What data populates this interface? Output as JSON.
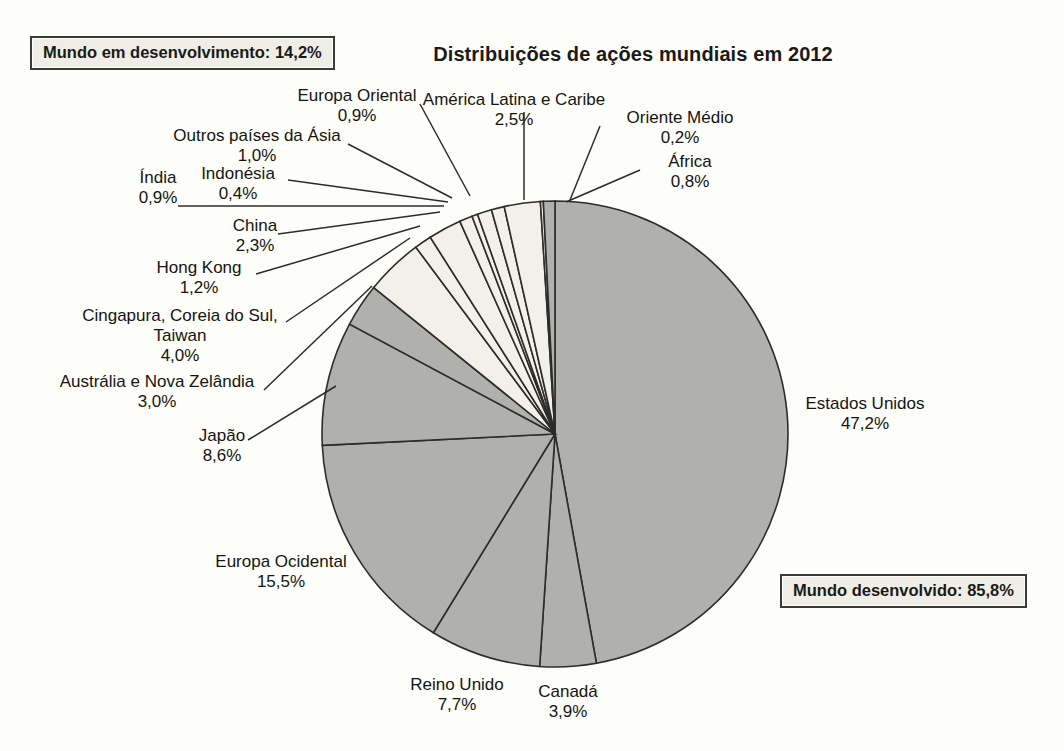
{
  "chart_data": {
    "type": "pie",
    "title": "Distribuições de ações mundiais em 2012",
    "xlabel": "",
    "ylabel": "",
    "legend_position": "callout-labels",
    "grid": false,
    "unit": "%",
    "decimal_separator": ",",
    "categories": [
      "Estados Unidos",
      "Canadá",
      "Reino Unido",
      "Europa Ocidental",
      "Japão",
      "Austrália e Nova Zelândia",
      "Cingapura, Coreia do Sul, Taiwan",
      "Hong Kong",
      "China",
      "Índia",
      "Indonésia",
      "Outros países da Ásia",
      "Europa Oriental",
      "América Latina e Caribe",
      "Oriente Médio",
      "África"
    ],
    "values": [
      47.2,
      3.9,
      7.7,
      15.5,
      8.6,
      3.0,
      4.0,
      1.2,
      2.3,
      0.9,
      0.4,
      1.0,
      0.9,
      2.5,
      0.2,
      0.8
    ],
    "value_labels": [
      "47,2%",
      "3,9%",
      "7,7%",
      "15,5%",
      "8,6%",
      "3,0%",
      "4,0%",
      "1,2%",
      "2,3%",
      "0,9%",
      "0,4%",
      "1,0%",
      "0,9%",
      "2,5%",
      "0,2%",
      "0,8%"
    ],
    "groups": [
      {
        "name": "Mundo desenvolvido",
        "value": 85.8,
        "value_label": "85,8%",
        "color": "#b0b0ac"
      },
      {
        "name": "Mundo em desenvolvimento",
        "value": 14.2,
        "value_label": "14,2%",
        "color": "#f2f0e8"
      }
    ],
    "slice_group": [
      "Mundo desenvolvido",
      "Mundo desenvolvido",
      "Mundo desenvolvido",
      "Mundo desenvolvido",
      "Mundo desenvolvido",
      "Mundo desenvolvido",
      "Mundo em desenvolvimento",
      "Mundo em desenvolvimento",
      "Mundo em desenvolvimento",
      "Mundo em desenvolvimento",
      "Mundo em desenvolvimento",
      "Mundo em desenvolvimento",
      "Mundo em desenvolvimento",
      "Mundo em desenvolvimento",
      "Mundo em desenvolvimento",
      "Mundo desenvolvido"
    ]
  },
  "header": {
    "title": "Distribuições de ações mundiais em 2012"
  },
  "callouts": {
    "developing": "Mundo em desenvolvimento: 14,2%",
    "developed": "Mundo desenvolvido: 85,8%"
  },
  "labels": {
    "estados_unidos": {
      "name": "Estados Unidos",
      "value": "47,2%"
    },
    "canada": {
      "name": "Canadá",
      "value": "3,9%"
    },
    "reino_unido": {
      "name": "Reino Unido",
      "value": "7,7%"
    },
    "europa_ocidental": {
      "name": "Europa Ocidental",
      "value": "15,5%"
    },
    "japao": {
      "name": "Japão",
      "value": "8,6%"
    },
    "australia_nz": {
      "name": "Austrália e Nova Zelândia",
      "value": "3,0%"
    },
    "cingapura": {
      "name": "Cingapura, Coreia do Sul,",
      "name2": "Taiwan",
      "value": "4,0%"
    },
    "hong_kong": {
      "name": "Hong Kong",
      "value": "1,2%"
    },
    "china": {
      "name": "China",
      "value": "2,3%"
    },
    "india": {
      "name": "Índia",
      "value": "0,9%"
    },
    "indonesia": {
      "name": "Indonésia",
      "value": "0,4%"
    },
    "outros_asia": {
      "name": "Outros países da Ásia",
      "value": "1,0%"
    },
    "europa_oriental": {
      "name": "Europa Oriental",
      "value": "0,9%"
    },
    "america_latina": {
      "name": "América Latina e Caribe",
      "value": "2,5%"
    },
    "oriente_medio": {
      "name": "Oriente Médio",
      "value": "0,2%"
    },
    "africa": {
      "name": "África",
      "value": "0,8%"
    }
  },
  "geometry": {
    "center_x": 555,
    "center_y": 434,
    "radius": 233,
    "start_angle_deg": -90,
    "direction": "clockwise"
  },
  "colors": {
    "developed_fill": "#b0b0ac",
    "developing_fill": "#f2f0e8",
    "outline": "#2c2c2a",
    "background": "#fdfdfa",
    "text": "#15150f",
    "callout_fill": "#eeeee7"
  }
}
